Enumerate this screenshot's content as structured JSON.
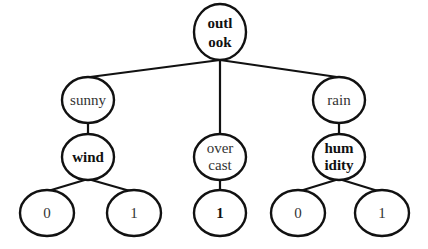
{
  "diagram": {
    "type": "decision-tree",
    "nodes": {
      "outlook": {
        "lines": [
          "outl",
          "ook"
        ],
        "bold": true
      },
      "sunny": {
        "lines": [
          "sunny"
        ],
        "bold": false
      },
      "overcast": {
        "lines": [
          "over",
          "cast"
        ],
        "bold": false
      },
      "rain": {
        "lines": [
          "rain"
        ],
        "bold": false
      },
      "wind": {
        "lines": [
          "wind"
        ],
        "bold": true
      },
      "overcast_leaf": {
        "lines": [
          "1"
        ],
        "bold": true
      },
      "humidity": {
        "lines": [
          "hum",
          "idity"
        ],
        "bold": true
      },
      "wind_leaf_0": {
        "lines": [
          "0"
        ],
        "bold": false
      },
      "wind_leaf_1": {
        "lines": [
          "1"
        ],
        "bold": false
      },
      "humidity_leaf_0": {
        "lines": [
          "0"
        ],
        "bold": false
      },
      "humidity_leaf_1": {
        "lines": [
          "1"
        ],
        "bold": false
      }
    },
    "edges": [
      [
        "outlook",
        "sunny"
      ],
      [
        "outlook",
        "overcast"
      ],
      [
        "outlook",
        "rain"
      ],
      [
        "sunny",
        "wind"
      ],
      [
        "overcast",
        "overcast_leaf"
      ],
      [
        "rain",
        "humidity"
      ],
      [
        "wind",
        "wind_leaf_0"
      ],
      [
        "wind",
        "wind_leaf_1"
      ],
      [
        "humidity",
        "humidity_leaf_0"
      ],
      [
        "humidity",
        "humidity_leaf_1"
      ]
    ]
  }
}
